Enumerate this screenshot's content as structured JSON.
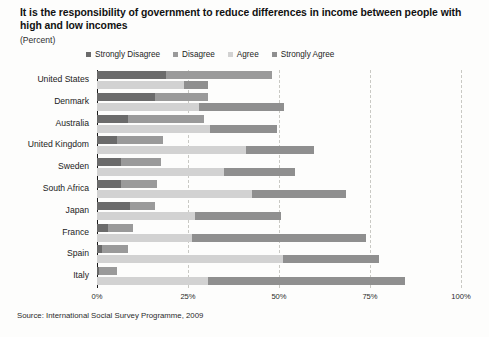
{
  "chart_data": {
    "type": "bar",
    "orientation": "horizontal",
    "subtype": "grouped-stacked",
    "title": "It is the responsibility of government to reduce differences in income between people with high and low incomes",
    "subtitle": "(Percent)",
    "source": "Source: International Social Survey Programme, 2009",
    "xlabel": "",
    "ylabel": "",
    "xlim": [
      0,
      100
    ],
    "xticks": [
      0,
      25,
      50,
      75,
      100
    ],
    "xtick_labels": [
      "0%",
      "25%",
      "50%",
      "75%",
      "100%"
    ],
    "grid": true,
    "legend_position": "top",
    "categories": [
      "United States",
      "Denmark",
      "Australia",
      "United Kingdom",
      "Sweden",
      "South Africa",
      "Japan",
      "France",
      "Spain",
      "Italy"
    ],
    "series": [
      {
        "name": "Strongly Disagree",
        "color": "#6b6b6b",
        "row": "upper",
        "values": [
          19,
          16,
          8.5,
          5.5,
          6.5,
          6.5,
          9,
          3,
          1.5,
          0.5
        ]
      },
      {
        "name": "Disagree",
        "color": "#9a9a9a",
        "row": "upper",
        "values": [
          29,
          14.5,
          21,
          12.5,
          11,
          10,
          7,
          7,
          7,
          5
        ]
      },
      {
        "name": "Agree",
        "color": "#d2d2d2",
        "row": "lower",
        "values": [
          24,
          28,
          31,
          41,
          35,
          42.5,
          27,
          26,
          51,
          30.5
        ]
      },
      {
        "name": "Strongly Agree",
        "color": "#8f8f8f",
        "row": "lower",
        "values": [
          6.5,
          23.5,
          18.5,
          18.5,
          19.5,
          26,
          23.5,
          48,
          26.5,
          54
        ]
      }
    ]
  },
  "legend": {
    "items": [
      {
        "label": "Strongly Disagree",
        "color": "#6b6b6b"
      },
      {
        "label": "Disagree",
        "color": "#9a9a9a"
      },
      {
        "label": "Agree",
        "color": "#d2d2d2"
      },
      {
        "label": "Strongly Agree",
        "color": "#8f8f8f"
      }
    ]
  }
}
